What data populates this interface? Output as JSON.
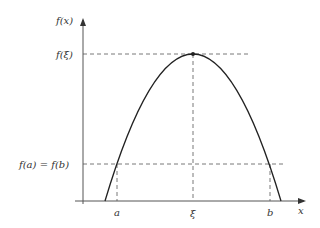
{
  "diagram": {
    "y_axis_label": "f(x)",
    "x_axis_label": "x",
    "y_ticks": [
      {
        "label": "f(ξ)",
        "y": 54
      },
      {
        "label": "f(a) = f(b)",
        "y": 164
      }
    ],
    "x_ticks": [
      {
        "label": "a",
        "x": 117
      },
      {
        "label": "ξ",
        "x": 193
      },
      {
        "label": "b",
        "x": 270
      }
    ],
    "curve": {
      "type": "parabola",
      "start": [
        105,
        201
      ],
      "peak": [
        193,
        54
      ],
      "end": [
        281,
        201
      ]
    },
    "colors": {
      "axis": "#444444",
      "curve": "#222222",
      "dashed": "#555555",
      "text": "#333333"
    }
  }
}
